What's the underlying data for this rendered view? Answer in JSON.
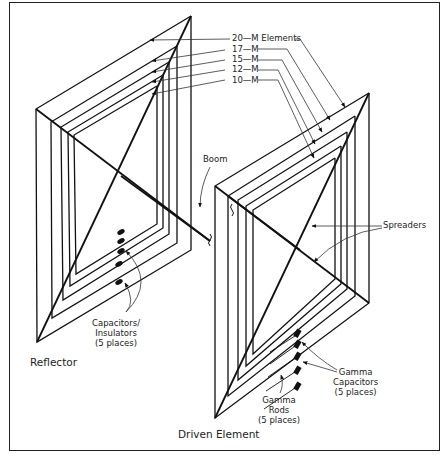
{
  "figure": {
    "frame_color": "#222222",
    "line_color": "#111111",
    "leader_color": "#333333"
  },
  "labels": {
    "band_20": "20—M Elements",
    "band_17": "17—M",
    "band_15": "15—M",
    "band_12": "12—M",
    "band_10": "10—M",
    "boom": "Boom",
    "spreaders": "Spreaders",
    "capacitors_insulators": "Capacitors/\nInsulators\n(5 places)",
    "reflector": "Reflector",
    "gamma_capacitors": "Gamma\nCapacitors\n(5 places)",
    "gamma_rods": "Gamma\nRods\n(5 places)",
    "driven_element": "Driven Element"
  },
  "elements": {
    "reflector": {
      "name": "Reflector",
      "loops": [
        {
          "band": "20-M",
          "top": [
            191,
            16
          ],
          "left": [
            36,
            109
          ],
          "bottom": [
            37,
            342
          ],
          "right": [
            191,
            250
          ]
        },
        {
          "band": "17-M",
          "top": [
            177,
            46
          ],
          "left": [
            51,
            122
          ],
          "bottom": [
            52,
            318
          ],
          "right": [
            177,
            243
          ]
        },
        {
          "band": "15-M",
          "top": [
            169,
            62
          ],
          "left": [
            61,
            127
          ],
          "bottom": [
            63,
            300
          ],
          "right": [
            169,
            234
          ]
        },
        {
          "band": "12-M",
          "top": [
            163,
            75
          ],
          "left": [
            68,
            132
          ],
          "bottom": [
            70,
            286
          ],
          "right": [
            163,
            228
          ]
        },
        {
          "band": "10-M",
          "top": [
            157,
            86
          ],
          "left": [
            74,
            135
          ],
          "bottom": [
            76,
            274
          ],
          "right": [
            157,
            224
          ]
        }
      ],
      "spreaders": [
        {
          "from": [
            191,
            16
          ],
          "to": [
            92,
            462
          ]
        },
        {
          "from": [
            36,
            109
          ],
          "to": [
            210,
            241
          ]
        }
      ]
    },
    "driven": {
      "name": "Driven Element",
      "loops": [
        {
          "band": "20-M",
          "top": [
            369,
            93
          ],
          "left": [
            215,
            186
          ],
          "bottom": [
            215,
            418
          ],
          "right": [
            369,
            303
          ]
        },
        {
          "band": "17-M",
          "top": [
            355,
            116
          ],
          "left": [
            228,
            196
          ],
          "bottom": [
            228,
            396
          ],
          "right": [
            355,
            296
          ]
        },
        {
          "band": "15-M",
          "top": [
            347,
            132
          ],
          "left": [
            238,
            200
          ],
          "bottom": [
            238,
            380
          ],
          "right": [
            347,
            289
          ]
        },
        {
          "band": "12-M",
          "top": [
            341,
            146
          ],
          "left": [
            246,
            206
          ],
          "bottom": [
            246,
            366
          ],
          "right": [
            341,
            284
          ]
        },
        {
          "band": "10-M",
          "top": [
            335,
            158
          ],
          "left": [
            253,
            210
          ],
          "bottom": [
            253,
            354
          ],
          "right": [
            335,
            279
          ]
        }
      ],
      "spreaders": [
        {
          "from": [
            369,
            93
          ],
          "to": [
            215,
            418
          ]
        },
        {
          "from": [
            215,
            186
          ],
          "to": [
            369,
            303
          ]
        }
      ]
    }
  }
}
